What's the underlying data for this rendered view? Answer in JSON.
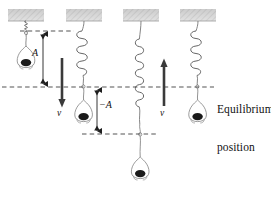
{
  "figure": {
    "background_color": "#ffffff",
    "ink_color": "#2b2b2b",
    "dash_color": "#4a4a4a",
    "arrow_color": "#3a3a3a",
    "ceiling_color": "#c9c9c9"
  },
  "labels": {
    "equilibrium_line1": "Equilibrium",
    "equilibrium_line2": "position",
    "amplitude_positive": "A",
    "amplitude_negative": "−A",
    "velocity_down": "v",
    "velocity_up": "v"
  },
  "reference_lines": [
    {
      "name": "upper-amplitude-line",
      "y": 31,
      "x_start": 20,
      "x_end": 72,
      "style": "dashed"
    },
    {
      "name": "equilibrium-line",
      "y": 87,
      "x_start": 2,
      "x_end": 214,
      "style": "dashed"
    },
    {
      "name": "lower-amplitude-line",
      "y": 134,
      "x_start": 82,
      "x_end": 158,
      "style": "dashed"
    }
  ],
  "panels": [
    {
      "name": "panel-1-maximum-upward-displacement",
      "cx": 26,
      "ceiling": {
        "x": 8,
        "y": 9,
        "width": 36,
        "height": 12
      },
      "spring": {
        "state": "compressed",
        "top": 21,
        "bottom": 33,
        "coils": 5,
        "radius": 5
      },
      "mass_center_y": 60,
      "displacement": "A",
      "velocity": "zero"
    },
    {
      "name": "panel-2-moving-down-through-equilibrium",
      "cx": 84,
      "ceiling": {
        "x": 66,
        "y": 9,
        "width": 36,
        "height": 12
      },
      "spring": {
        "state": "stretched",
        "top": 21,
        "bottom": 84,
        "coils": 5,
        "radius": 8
      },
      "mass_center_y": 114,
      "displacement": "0",
      "velocity": "downward"
    },
    {
      "name": "panel-3-maximum-downward-displacement",
      "cx": 141,
      "ceiling": {
        "x": 123,
        "y": 9,
        "width": 36,
        "height": 12
      },
      "spring": {
        "state": "fully-stretched",
        "top": 21,
        "bottom": 132,
        "coils": 5,
        "radius": 6
      },
      "mass_center_y": 175,
      "displacement": "−A",
      "velocity": "zero"
    },
    {
      "name": "panel-4-moving-up-through-equilibrium",
      "cx": 198,
      "ceiling": {
        "x": 180,
        "y": 9,
        "width": 36,
        "height": 12
      },
      "spring": {
        "state": "stretched",
        "top": 21,
        "bottom": 84,
        "coils": 5,
        "radius": 8
      },
      "mass_center_y": 114,
      "displacement": "0",
      "velocity": "upward"
    }
  ],
  "arrows": [
    {
      "name": "velocity-arrow-down",
      "x": 62,
      "y_start": 58,
      "y_end": 106,
      "direction": "down",
      "label": "v"
    },
    {
      "name": "velocity-arrow-up",
      "x": 164,
      "y_start": 106,
      "y_end": 58,
      "direction": "up",
      "label": "v"
    }
  ],
  "dimension_arrows": [
    {
      "name": "amplitude-A-arrow",
      "x": 43,
      "y_top": 31,
      "y_bottom": 87,
      "label": "A",
      "label_x": 34,
      "label_y": 53
    },
    {
      "name": "amplitude-negative-A-arrow",
      "x": 97,
      "y_top": 87,
      "y_bottom": 134,
      "label": "−A",
      "label_x": 100,
      "label_y": 104
    }
  ]
}
